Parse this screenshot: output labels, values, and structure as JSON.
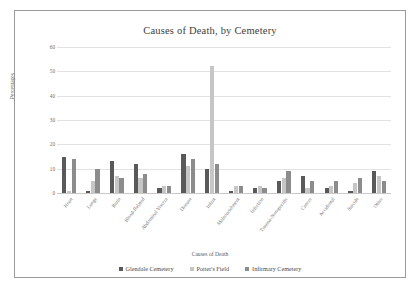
{
  "chart_data": {
    "type": "bar",
    "title": "Causes of Death, by Cemetery",
    "xlabel": "Causes of Death",
    "ylabel": "Percentages",
    "ylim": [
      0,
      60
    ],
    "yticks": [
      "0",
      "10",
      "20",
      "30",
      "40",
      "50",
      "60"
    ],
    "grid": true,
    "legend_position": "bottom",
    "categories": [
      "Heart",
      "Lungs",
      "Brain",
      "Blood-Related",
      "Abdominal Viscera",
      "Disease",
      "Infant",
      "Malnourishment",
      "Infection",
      "Trauma-Nonspecific",
      "Cancer",
      "Accidental",
      "Suicide",
      "Other"
    ],
    "series": [
      {
        "name": "Glendale Cemetery",
        "color": "#595959",
        "values": [
          15,
          1,
          13,
          12,
          2,
          16,
          10,
          1,
          2,
          5,
          7,
          2,
          1,
          9
        ]
      },
      {
        "name": "Potter's Field",
        "color": "#c6c6c6",
        "values": [
          1,
          5,
          7,
          6,
          3,
          11,
          52,
          3,
          3,
          6,
          2,
          3,
          4,
          7
        ]
      },
      {
        "name": "Infirmary Cemetery",
        "color": "#8c8c8c",
        "values": [
          14,
          10,
          6,
          8,
          3,
          14,
          12,
          3,
          2,
          9,
          5,
          5,
          6,
          5
        ]
      }
    ]
  },
  "legend": {
    "items": [
      {
        "label": "Glendale Cemetery"
      },
      {
        "label": "Potter's Field"
      },
      {
        "label": "Infirmary Cemetery"
      }
    ]
  }
}
